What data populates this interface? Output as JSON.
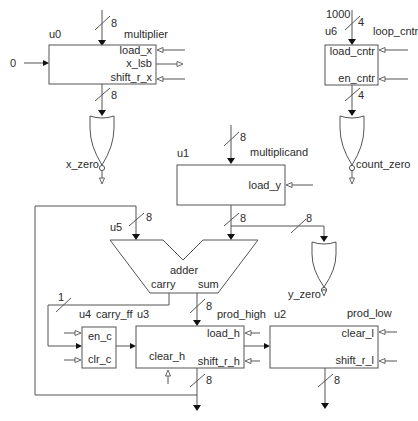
{
  "diagram": {
    "type": "datapath-block-diagram",
    "blocks": {
      "u0": {
        "id": "u0",
        "name": "multiplier",
        "ports": [
          "load_x",
          "x_lsb",
          "shift_r_x"
        ],
        "input_const": "0",
        "bus_in": "8",
        "bus_out": "8"
      },
      "u6": {
        "id": "u6",
        "name": "loop_cntr",
        "ports": [
          "load_cntr",
          "en_cntr"
        ],
        "input_const": "1000",
        "bus_in": "4",
        "bus_out": "4"
      },
      "u1": {
        "id": "u1",
        "name": "multiplicand",
        "ports": [
          "load_y"
        ],
        "bus_in": "8",
        "bus_out": "8"
      },
      "u5": {
        "id": "u5",
        "name": "adder",
        "ports": [
          "carry",
          "sum"
        ],
        "bus_in": "8",
        "bus_sum": "8",
        "bus_carry": "1"
      },
      "u4": {
        "id": "u4",
        "name": "carry_ff",
        "ports": [
          "en_c",
          "clr_c"
        ]
      },
      "u3": {
        "id": "u3",
        "name": "prod_high",
        "ports": [
          "load_h",
          "clear_h",
          "shift_r_h"
        ],
        "bus_out": "8"
      },
      "u2": {
        "id": "u2",
        "name": "prod_low",
        "ports": [
          "clear_l",
          "shift_r_l"
        ],
        "bus_out": "8"
      }
    },
    "gates": {
      "x_zero": {
        "type": "nor",
        "label": "x_zero"
      },
      "count_zero": {
        "type": "nor",
        "label": "count_zero"
      },
      "y_zero": {
        "type": "nor",
        "label": "y_zero",
        "bus_in": "8"
      }
    }
  }
}
